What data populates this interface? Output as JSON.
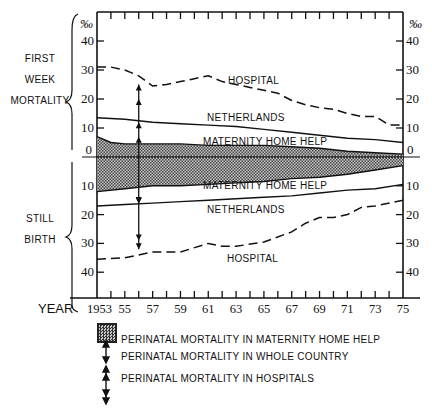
{
  "chart_data": {
    "type": "line",
    "title": "",
    "xlabel": "YEAR",
    "ylabel": "‰",
    "unit": "‰",
    "x_ticks": [
      "1953",
      "55",
      "57",
      "59",
      "61",
      "63",
      "65",
      "67",
      "69",
      "71",
      "73",
      "75"
    ],
    "x_range": [
      1953,
      1975
    ],
    "upper_panel": {
      "label_lines": [
        "FIRST",
        "WEEK",
        "MORTALITY"
      ],
      "y_ticks": [
        0,
        10,
        20,
        30,
        40
      ],
      "ylim": [
        0,
        45
      ],
      "series": [
        {
          "name": "HOSPITAL",
          "style": "dashed",
          "x": [
            1953,
            1954,
            1955,
            1956,
            1957,
            1958,
            1959,
            1960,
            1961,
            1962,
            1963,
            1964,
            1965,
            1966,
            1967,
            1968,
            1969,
            1970,
            1971,
            1972,
            1973,
            1974,
            1975
          ],
          "values": [
            31,
            31,
            30,
            28,
            24.5,
            25,
            26,
            27,
            28,
            26,
            25,
            24,
            23,
            22,
            19.5,
            18,
            17,
            16.5,
            15,
            14,
            14,
            11,
            11
          ]
        },
        {
          "name": "NETHERLANDS",
          "style": "solid",
          "x": [
            1953,
            1955,
            1957,
            1959,
            1961,
            1963,
            1965,
            1967,
            1969,
            1971,
            1973,
            1975
          ],
          "values": [
            13.5,
            13,
            12,
            11.5,
            11,
            10.5,
            9.5,
            8.5,
            7.5,
            6.5,
            6,
            5
          ]
        },
        {
          "name": "MATERNITY HOME HELP",
          "style": "solid-shaded",
          "x": [
            1953,
            1954,
            1955,
            1957,
            1959,
            1961,
            1963,
            1965,
            1967,
            1969,
            1971,
            1973,
            1975
          ],
          "values": [
            7,
            5,
            4.5,
            4.5,
            4.5,
            4,
            4,
            4,
            3.5,
            3,
            2,
            1.5,
            1
          ]
        }
      ]
    },
    "lower_panel": {
      "label_lines": [
        "STILL",
        "BIRTH"
      ],
      "y_ticks": [
        0,
        10,
        20,
        30,
        40
      ],
      "ylim": [
        0,
        45
      ],
      "inverted": true,
      "series": [
        {
          "name": "MATERNITY HOME HELP",
          "style": "solid-shaded",
          "x": [
            1953,
            1955,
            1957,
            1959,
            1961,
            1963,
            1965,
            1967,
            1969,
            1971,
            1973,
            1975
          ],
          "values": [
            12,
            11,
            10,
            10,
            9.5,
            9,
            8.5,
            7.5,
            7,
            6,
            4.5,
            3
          ]
        },
        {
          "name": "NETHERLANDS",
          "style": "solid",
          "x": [
            1953,
            1955,
            1957,
            1959,
            1961,
            1963,
            1965,
            1967,
            1969,
            1971,
            1973,
            1975
          ],
          "values": [
            17,
            16.5,
            16,
            15.5,
            15,
            14.5,
            14,
            13.5,
            12.5,
            11.5,
            11,
            9.5
          ]
        },
        {
          "name": "HOSPITAL",
          "style": "dashed",
          "x": [
            1953,
            1955,
            1957,
            1959,
            1961,
            1962,
            1963,
            1965,
            1967,
            1968,
            1969,
            1970,
            1971,
            1972,
            1973,
            1975
          ],
          "values": [
            35.5,
            35,
            33,
            33,
            30,
            31,
            31,
            29.5,
            26,
            23,
            21,
            21,
            20,
            17.5,
            17,
            15
          ]
        }
      ]
    },
    "annotations": [
      {
        "type": "arrow",
        "x": 1956,
        "desc": "whole-country perinatal mortality (single arrows) and hospital perinatal mortality (double arrows) spans"
      }
    ],
    "legend": [
      {
        "symbol": "shaded-box",
        "text": "PERINATAL MORTALITY IN MATERNITY HOME HELP"
      },
      {
        "symbol": "double-arrow",
        "text": "PERINATAL MORTALITY IN  WHOLE COUNTRY"
      },
      {
        "symbol": "quad-arrow",
        "text": "PERINATAL MORTALITY IN HOSPITALS"
      }
    ],
    "grid": false,
    "legend_position": "bottom"
  },
  "labels": {
    "upper": [
      "FIRST",
      "WEEK",
      "MORTALITY"
    ],
    "lower": [
      "STILL",
      "BIRTH"
    ],
    "permille": "‰",
    "year": "YEAR",
    "hospital": "HOSPITAL",
    "netherlands": "NETHERLANDS",
    "mhh": "MATERNITY HOME HELP"
  }
}
